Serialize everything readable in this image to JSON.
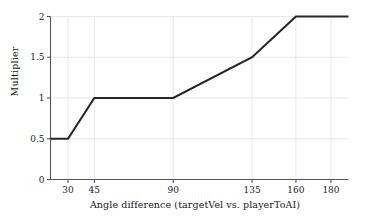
{
  "chart_data": {
    "type": "line",
    "title": "",
    "xlabel": "Angle difference (targetVel vs. playerToAI)",
    "ylabel": "Multiplier",
    "x": [
      20,
      30,
      45,
      90,
      135,
      160,
      180,
      190
    ],
    "values": [
      0.5,
      0.5,
      1.0,
      1.0,
      1.5,
      2.0,
      2.0,
      2.0
    ],
    "series": [
      {
        "name": "Multiplier",
        "points": [
          {
            "x": 20,
            "y": 0.5
          },
          {
            "x": 30,
            "y": 0.5
          },
          {
            "x": 45,
            "y": 1.0
          },
          {
            "x": 90,
            "y": 1.0
          },
          {
            "x": 135,
            "y": 1.5
          },
          {
            "x": 160,
            "y": 2.0
          },
          {
            "x": 180,
            "y": 2.0
          },
          {
            "x": 190,
            "y": 2.0
          }
        ],
        "color": "#262626"
      }
    ],
    "xticks": [
      30,
      45,
      90,
      135,
      160,
      180
    ],
    "xticklabels": [
      "30",
      "45",
      "90",
      "135",
      "160",
      "180"
    ],
    "yticks": [
      0,
      0.5,
      1,
      1.5,
      2
    ],
    "yticklabels": [
      "0",
      "0.5",
      "1",
      "1.5",
      "2"
    ],
    "xlim": [
      20,
      190
    ],
    "ylim": [
      0,
      2
    ],
    "grid": true,
    "grid_color": "#e8e8e8",
    "axis_color": "#555555",
    "line_color": "#262626",
    "line_width": 2.1,
    "legend": null,
    "background": "#ffffff"
  }
}
